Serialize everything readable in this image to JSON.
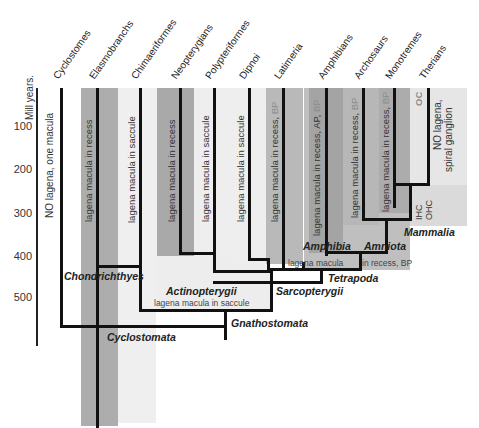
{
  "axis": {
    "title": "Mill years.",
    "ticks": [
      "100",
      "200",
      "300",
      "400",
      "500"
    ]
  },
  "taxa": [
    "Cyclostomes",
    "Elasmobranchs",
    "Chimaeriformes",
    "Neopterygians",
    "Polypteriformes",
    "Dipnoi",
    "Latimeria",
    "Amphibians",
    "Archosaurs",
    "Monotremes",
    "Therians"
  ],
  "annotations": {
    "cyclostomes": "NO lagena, one macula",
    "elasmobranchs": "lagena macula in recess",
    "chimaeriformes": "lagena macula in saccule",
    "neopterygians": "lagena macula in recess",
    "polypteriformes": "lagena macula in saccule",
    "dipnoi_main": "lagena macula in saccule",
    "latimeria_main": "lagena macula in recess,",
    "latimeria_bp": "BP",
    "amphibians_main": "lagena macula in recess, AP,",
    "amphibians_bp": "BP",
    "archosaurs_main": "lagena macula in recess,",
    "archosaurs_bp": "BP",
    "monotremes_main": "lagena macula in recess,",
    "monotremes_bp": "BP",
    "therians_oc": "OC",
    "therians_line1": "NO lagena,",
    "therians_line2": "spiral ganglion",
    "hair_cells_1": "IHC",
    "hair_cells_2": "OHC",
    "tetrapoda_note_1": "lagena macula",
    "tetrapoda_note_2": "in recess, BP",
    "gnathostomata_note": "lagena macula in saccule"
  },
  "clades": {
    "chondrichthyes": "Chondrichthyes",
    "actinopterygii": "Actinopterygii",
    "sarcopterygii": "Sarcopterygii",
    "tetrapoda": "Tetrapoda",
    "amphibia": "Amphibia",
    "amniota": "Amniota",
    "mammalia": "Mammalia",
    "gnathostomata": "Gnathostomata",
    "cyclostomata": "Cyclostomata"
  },
  "colors": {
    "line": "#111111",
    "dark_gray": "#a9a9a9",
    "mid_gray": "#bdbdbd",
    "light_gray": "#ededed",
    "pale_gray": "#e2e2e2",
    "bp_text": "#8d8d8d"
  }
}
